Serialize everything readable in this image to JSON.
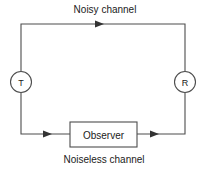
{
  "diagram": {
    "labels": {
      "top_channel": "Noisy channel",
      "bottom_channel": "Noiseless channel"
    },
    "nodes": [
      {
        "id": "transmitter",
        "shape": "circle",
        "label": "T"
      },
      {
        "id": "receiver",
        "shape": "circle",
        "label": "R"
      },
      {
        "id": "observer",
        "shape": "rectangle",
        "label": "Observer"
      }
    ],
    "colors": {
      "background": "#ffffff",
      "line": "#4d4d4d",
      "text": "#1a1a1a",
      "arrow": "#333333"
    },
    "arrows": [
      {
        "id": "top-arrow",
        "direction": "right"
      },
      {
        "id": "bottom-left-arrow",
        "direction": "right"
      },
      {
        "id": "bottom-right-arrow",
        "direction": "right"
      }
    ]
  }
}
